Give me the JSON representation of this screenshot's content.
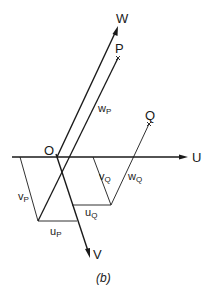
{
  "diagram": {
    "caption": "(b)",
    "axes": {
      "u": {
        "label": "U"
      },
      "v": {
        "label": "V"
      },
      "w": {
        "label": "W"
      },
      "origin": {
        "label": "O"
      }
    },
    "points": {
      "p": {
        "label": "P"
      },
      "q": {
        "label": "Q"
      }
    },
    "components": {
      "w_p": {
        "base": "w",
        "sub": "P"
      },
      "v_p": {
        "base": "v",
        "sub": "P"
      },
      "u_p": {
        "base": "u",
        "sub": "P"
      },
      "v_q": {
        "base": "v",
        "sub": "Q"
      },
      "u_q": {
        "base": "u",
        "sub": "Q"
      },
      "w_q": {
        "base": "w",
        "sub": "Q"
      }
    },
    "colors": {
      "line": "#1a1a1a",
      "background": "#ffffff"
    }
  }
}
